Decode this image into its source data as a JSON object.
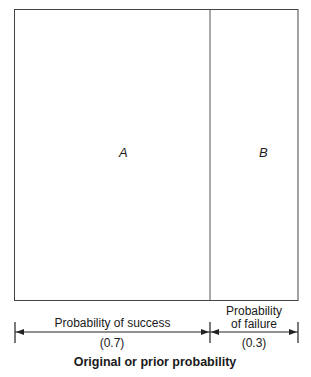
{
  "diagram": {
    "regions": [
      {
        "label": "A",
        "fraction": 0.7
      },
      {
        "label": "B",
        "fraction": 0.3
      }
    ],
    "success": {
      "label": "Probability of success",
      "value": "(0.7)"
    },
    "failure": {
      "label_line1": "Probability",
      "label_line2": "of failure",
      "value": "(0.3)"
    },
    "caption": "Original or prior probability"
  }
}
